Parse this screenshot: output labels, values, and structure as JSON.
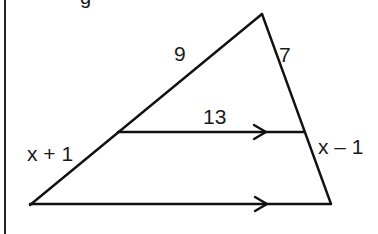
{
  "figure": {
    "title_fragment": "g",
    "colors": {
      "stroke": "#111111",
      "text": "#1a1a1a",
      "background": "#ffffff"
    },
    "vertices": {
      "apex": [
        262,
        14
      ],
      "bottom_left": [
        30,
        205
      ],
      "bottom_right": [
        331,
        204
      ],
      "mid_left": [
        118,
        133
      ],
      "mid_right": [
        304,
        132
      ]
    },
    "labels": {
      "upper_left_side": "9",
      "upper_right_side": "7",
      "parallel_segment": "13",
      "lower_left_side": "x + 1",
      "lower_right_side": "x – 1"
    },
    "parallel_markers": [
      "arrow",
      "arrow"
    ]
  }
}
